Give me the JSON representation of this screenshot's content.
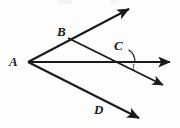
{
  "figure": {
    "background_color": "#fdfdfd",
    "stroke_color": "#1a1a1a",
    "labels": {
      "point_a": "A",
      "point_b": "B",
      "point_c": "C",
      "point_d": "D",
      "angle_one": "1"
    },
    "geometry": {
      "vertex_a": [
        28,
        62
      ],
      "point_b": [
        68,
        38
      ],
      "point_c": [
        120,
        62
      ],
      "point_d": [
        104,
        100
      ],
      "rays": [
        {
          "name": "ray-AB",
          "from": [
            28,
            62
          ],
          "to": [
            132,
            7
          ],
          "arrow": true
        },
        {
          "name": "ray-A-horizontal",
          "from": [
            28,
            62
          ],
          "to": [
            174,
            62
          ],
          "arrow": true
        },
        {
          "name": "ray-AD",
          "from": [
            28,
            62
          ],
          "to": [
            142,
            120
          ],
          "arrow": true
        },
        {
          "name": "ray-BC",
          "from": [
            68,
            38
          ],
          "to": [
            166,
            87
          ],
          "arrow": true
        }
      ],
      "angle_arc": {
        "name": "angle-1-arc",
        "vertex": [
          120,
          62
        ],
        "radius": 15
      }
    }
  }
}
